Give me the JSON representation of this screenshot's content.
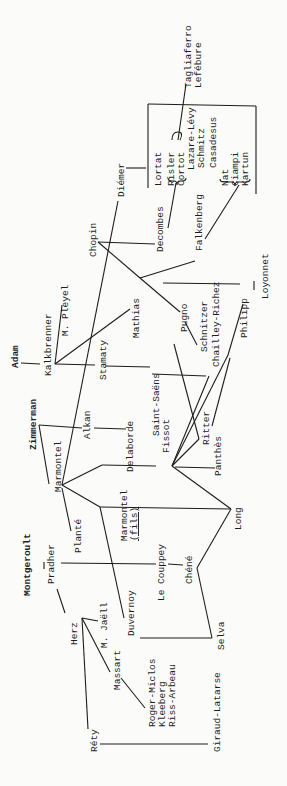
{
  "diagram": {
    "orientation": "rotated-counterclockwise",
    "nodes": {
      "adam": "Adam",
      "kalkbrenner": "Kalkbrenner",
      "m_pleyel": "M. Pleyel",
      "zimmerman": "Zimmerman",
      "montgeroult": "Montgeroult",
      "pradher": "Pradher",
      "herz": "Herz",
      "m_jaell": "M. Jaëll",
      "massart": "Massart",
      "rety": "Réty",
      "roger_miclos": "Roger-Miclos",
      "kleeberg": "Kleeberg",
      "riss_arbeau": "Riss-Arbeau",
      "giraud_latarse": "Giraud-Latarse",
      "marmontel": "Marmontel",
      "plante": "Planté",
      "alkan": "Alkan",
      "delaborde": "Delaborde",
      "stamaty": "Stamaty",
      "saint_saens": "Saint-Saëns",
      "marmontel_fils": "Marmontel",
      "marmontel_fils_suffix": "(fils)",
      "duvernoy": "Duvernoy",
      "le_couppey": "Le Couppey",
      "chene": "Chéné",
      "selva": "Selva",
      "long": "Long",
      "fissot": "Fissot",
      "ritter": "Ritter",
      "panthes": "Panthès",
      "chopin": "Chopin",
      "mathias": "Mathias",
      "pugno": "Pugno",
      "schnitzer": "Schnitzer",
      "chailley_richez": "Chailley-Richez",
      "philipp": "Philipp",
      "loyonnet": "Loyonnet",
      "falkenberg": "Falkenberg",
      "decombes": "Decombes",
      "diemer": "Diémer",
      "lortat": "Lortat",
      "risler": "Risler",
      "cortot": "Cortot",
      "lazare_levy": "Lazare-Lévy",
      "schmitz": "Schmitz",
      "casadesus": "Casadesus",
      "nat": "Nat",
      "ciampi": "Ciampi",
      "kartun": "Kartun",
      "tagliaferro": "Tagliaferro",
      "lefebure": "Lefébure"
    }
  }
}
